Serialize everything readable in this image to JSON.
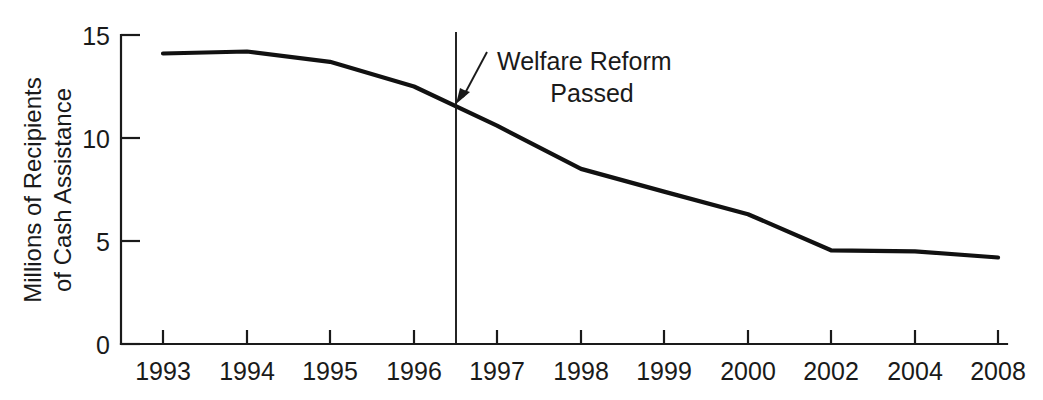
{
  "chart_data": {
    "type": "line",
    "title": "",
    "xlabel": "",
    "ylabel": "Millions of Recipients of Cash Assistance",
    "ylabel_line1": "Millions of Recipients",
    "ylabel_line2": "of Cash Assistance",
    "categories": [
      "1993",
      "1994",
      "1995",
      "1996",
      "1997",
      "1998",
      "1999",
      "2000",
      "2002",
      "2004",
      "2008"
    ],
    "values": [
      14.1,
      14.2,
      13.7,
      12.5,
      10.6,
      8.5,
      7.4,
      6.3,
      4.55,
      4.5,
      4.2
    ],
    "x_tick_labels": [
      "1993",
      "1994",
      "1995",
      "1996",
      "1997",
      "1998",
      "1999",
      "2000",
      "2002",
      "2004",
      "2008"
    ],
    "y_tick_labels": [
      "0",
      "5",
      "10",
      "15"
    ],
    "y_tick_values": [
      0,
      5,
      10,
      15
    ],
    "ylim": [
      0,
      15
    ],
    "grid": false,
    "legend": "none",
    "line_color": "#111111",
    "annotations": [
      {
        "name": "welfare-reform-marker",
        "text_line1": "Welfare Reform",
        "text_line2": "Passed",
        "text": "Welfare Reform Passed",
        "x_position": "mid-1996",
        "value_at_marker": 11.7,
        "marker_type": "vertical-line-with-arrow"
      }
    ]
  },
  "axis": {
    "y_title_line1": "Millions of Recipients",
    "y_title_line2": "of Cash Assistance"
  },
  "colors": {
    "background": "#ffffff",
    "ink": "#1a1a1a",
    "series": "#111111"
  }
}
